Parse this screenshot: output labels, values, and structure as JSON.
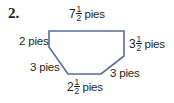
{
  "problem": {
    "number": "2."
  },
  "figure": {
    "type": "hexagon",
    "stroke_color": "#5a6ba0",
    "vertices": [
      [
        49,
        31
      ],
      [
        124,
        31
      ],
      [
        124,
        56
      ],
      [
        101,
        74
      ],
      [
        68,
        74
      ],
      [
        49,
        47
      ]
    ],
    "sides": [
      {
        "id": "top",
        "whole": "7",
        "numerator": "1",
        "denominator": "2",
        "unit": "pies"
      },
      {
        "id": "right",
        "whole": "3",
        "numerator": "1",
        "denominator": "2",
        "unit": "pies"
      },
      {
        "id": "lower-right",
        "text": "3 pies"
      },
      {
        "id": "bottom",
        "whole": "2",
        "numerator": "1",
        "denominator": "2",
        "unit": "pies"
      },
      {
        "id": "lower-left",
        "text": "3 pies"
      },
      {
        "id": "left",
        "text": "2 pies"
      }
    ]
  }
}
